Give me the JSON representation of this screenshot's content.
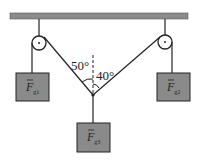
{
  "diagram": {
    "angles": {
      "left": "50°",
      "right": "40°"
    },
    "weights": [
      {
        "id": "g1",
        "label": "F",
        "sub": "g1"
      },
      {
        "id": "g2",
        "label": "F",
        "sub": "g2"
      },
      {
        "id": "g3",
        "label": "F",
        "sub": "g3"
      }
    ],
    "colors": {
      "ceiling": "#8c8c8c",
      "box": "#8a8a8a",
      "line": "#222222"
    }
  }
}
